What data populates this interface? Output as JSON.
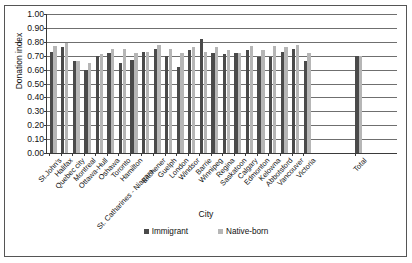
{
  "chart_data": {
    "type": "bar",
    "title": "",
    "xlabel": "City",
    "ylabel": "Donation index",
    "ylim": [
      0.0,
      1.0
    ],
    "ytick_labels": [
      "1.00",
      "0.90",
      "0.80",
      "0.70",
      "0.60",
      "0.50",
      "0.40",
      "0.30",
      "0.20",
      "0.10",
      "0.00"
    ],
    "ytick_values": [
      1.0,
      0.9,
      0.8,
      0.7,
      0.6,
      0.5,
      0.4,
      0.3,
      0.2,
      0.1,
      0.0
    ],
    "grid": true,
    "legend_position": "bottom",
    "categories": [
      "St.John's",
      "Halifax",
      "Quebec city",
      "Montreal",
      "Ottawa-Hull",
      "Oshawa",
      "Toronto",
      "Hamilton",
      "St. Catharines - Niagara",
      "Kitchener",
      "Guelph",
      "London",
      "Windsor",
      "Barrie",
      "Winnipeg",
      "Regina",
      "Saskatoon",
      "Calgary",
      "Edmonton",
      "Kelowna",
      "Abbotsford",
      "Vancouver",
      "Victoria",
      "Total"
    ],
    "series": [
      {
        "name": "Immigrant",
        "color": "#4a4a4a",
        "values": [
          0.73,
          0.76,
          0.66,
          0.6,
          0.7,
          0.72,
          0.65,
          0.67,
          0.73,
          0.75,
          0.7,
          0.62,
          0.74,
          0.82,
          0.72,
          0.71,
          0.72,
          0.74,
          0.69,
          0.69,
          0.73,
          0.75,
          0.66,
          0.7
        ]
      },
      {
        "name": "Native-born",
        "color": "#b6b6b6",
        "values": [
          0.77,
          0.79,
          0.66,
          0.65,
          0.71,
          0.75,
          0.75,
          0.72,
          0.73,
          0.78,
          0.75,
          0.72,
          0.76,
          0.73,
          0.76,
          0.74,
          0.72,
          0.77,
          0.74,
          0.77,
          0.76,
          0.78,
          0.72,
          0.7
        ]
      }
    ]
  }
}
